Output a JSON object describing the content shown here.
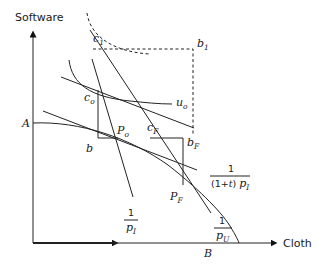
{
  "diagram": {
    "axes": {
      "y_label": "Software",
      "x_label": "Cloth"
    },
    "points": {
      "A": "A",
      "B": "B",
      "b": "b",
      "b1": {
        "base": "b",
        "sub": "1"
      },
      "bF": {
        "base": "b",
        "sub": "F"
      },
      "c1": {
        "base": "c",
        "sub": "1"
      },
      "co": {
        "base": "c",
        "sub": "o"
      },
      "cF": {
        "base": "c",
        "sub": "F"
      },
      "Po": {
        "base": "P",
        "sub": "o"
      },
      "PF": {
        "base": "P",
        "sub": "F"
      },
      "uo": {
        "base": "u",
        "sub": "o"
      }
    },
    "slope_labels": {
      "pI": {
        "num": "1",
        "den_base": "p",
        "den_sub": "I"
      },
      "tariff": {
        "num": "1",
        "den_prefix": "(1+",
        "den_t": "t",
        "den_mid": ") ",
        "den_base": "p",
        "den_sub": "I"
      },
      "pU": {
        "num": "1",
        "den_base": "p",
        "den_sub": "U"
      }
    }
  }
}
